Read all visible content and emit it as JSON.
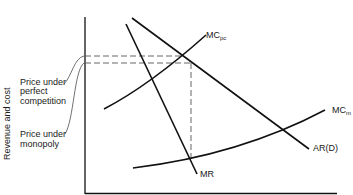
{
  "diagram": {
    "y_axis_label": "Revenue and cost",
    "annotations": {
      "price_perfect_competition": [
        "Price under",
        "perfect",
        "competition"
      ],
      "price_monopoly": [
        "Price under",
        "monopoly"
      ]
    },
    "curves": {
      "mc_pc": {
        "main": "MC",
        "sub": "pc"
      },
      "mc_m": {
        "main": "MC",
        "sub": "m"
      },
      "ar": "AR(D)",
      "mr": "MR"
    },
    "colors": {
      "line": "#111111",
      "dashed": "#555555",
      "text": "#1a1a1a"
    }
  }
}
